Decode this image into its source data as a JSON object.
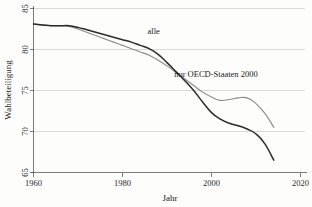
{
  "chart_data": {
    "type": "line",
    "title": "",
    "xlabel": "Jahr",
    "ylabel": "Wahlbeteiligung",
    "xlim": [
      1960,
      2020
    ],
    "ylim": [
      65,
      85
    ],
    "xticks": [
      1960,
      1980,
      2000,
      2020
    ],
    "yticks": [
      65,
      70,
      75,
      80,
      85
    ],
    "grid": true,
    "legend_position": "inline-annotations",
    "annotations": [
      {
        "text": "alle",
        "x": 1987,
        "y": 81.9
      },
      {
        "text": "nur OECD-Staaten 2000",
        "x": 2001,
        "y": 76.6
      }
    ],
    "series": [
      {
        "name": "alle",
        "color": "#2b2b2b",
        "x": [
          1960,
          1962,
          1964,
          1966,
          1968,
          1970,
          1972,
          1974,
          1976,
          1978,
          1980,
          1982,
          1984,
          1986,
          1988,
          1990,
          1992,
          1994,
          1996,
          1998,
          2000,
          2002,
          2004,
          2006,
          2008,
          2010,
          2012,
          2014
        ],
        "values": [
          83.1,
          83.0,
          82.9,
          82.9,
          82.9,
          82.7,
          82.4,
          82.1,
          81.8,
          81.5,
          81.2,
          80.9,
          80.5,
          80.1,
          79.4,
          78.4,
          77.3,
          76.2,
          75.0,
          73.6,
          72.3,
          71.5,
          71.0,
          70.7,
          70.3,
          69.7,
          68.5,
          66.5
        ]
      },
      {
        "name": "nur OECD-Staaten 2000",
        "color": "#8c8c8c",
        "x": [
          1960,
          1962,
          1964,
          1966,
          1968,
          1970,
          1972,
          1974,
          1976,
          1978,
          1980,
          1982,
          1984,
          1986,
          1988,
          1990,
          1992,
          1994,
          1996,
          1998,
          2000,
          2002,
          2004,
          2006,
          2008,
          2010,
          2012,
          2014
        ],
        "values": [
          83.1,
          83.0,
          82.9,
          82.9,
          82.8,
          82.5,
          82.1,
          81.7,
          81.3,
          80.9,
          80.5,
          80.1,
          79.7,
          79.3,
          78.7,
          78.0,
          77.2,
          76.4,
          75.6,
          74.8,
          74.2,
          73.8,
          73.9,
          74.1,
          74.1,
          73.4,
          72.2,
          70.5
        ]
      }
    ]
  }
}
